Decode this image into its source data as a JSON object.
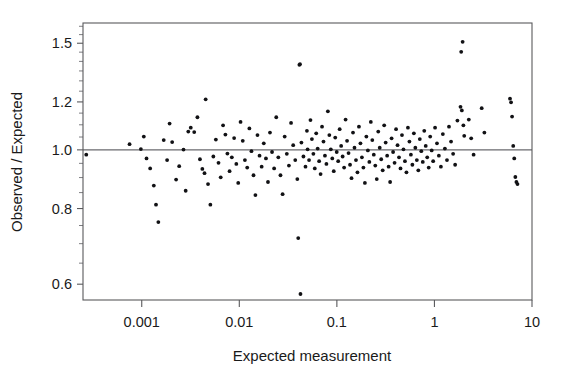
{
  "chart_data": {
    "type": "scatter",
    "title": "",
    "xlabel": "Expected measurement",
    "ylabel": "Observed / Expected",
    "xscale": "log",
    "yscale": "log",
    "xlim": [
      0.00025,
      10
    ],
    "ylim": [
      0.565,
      1.62
    ],
    "xticks": [
      0.001,
      0.01,
      0.1,
      1,
      10
    ],
    "xticklabels": [
      "0.001",
      "0.01",
      "0.1",
      "1",
      "10"
    ],
    "yticks": [
      0.6,
      0.8,
      1.0,
      1.2,
      1.5
    ],
    "yticklabels": [
      "0.6",
      "0.8",
      "1.0",
      "1.2",
      "1.5"
    ],
    "yminorticks": [
      0.65,
      0.7,
      0.75,
      0.85,
      0.9,
      0.95,
      1.05,
      1.1,
      1.15,
      1.25,
      1.3,
      1.35,
      1.4,
      1.45,
      1.55,
      1.6
    ],
    "grid": false,
    "legend": false,
    "reference_line": {
      "orientation": "horizontal",
      "value": 1.0,
      "label": "unity line"
    },
    "marker": {
      "shape": "circle",
      "color": "#111114",
      "size": 1.9
    },
    "n_points": 190,
    "points": [
      [
        0.00027,
        0.982
      ],
      [
        0.00075,
        1.022
      ],
      [
        0.00098,
        1.003
      ],
      [
        0.00105,
        1.052
      ],
      [
        0.00112,
        0.968
      ],
      [
        0.00122,
        0.932
      ],
      [
        0.00133,
        0.873
      ],
      [
        0.0014,
        0.812
      ],
      [
        0.00148,
        0.76
      ],
      [
        0.00168,
        1.038
      ],
      [
        0.00182,
        0.962
      ],
      [
        0.00193,
        1.105
      ],
      [
        0.00205,
        1.03
      ],
      [
        0.00225,
        0.893
      ],
      [
        0.00242,
        0.94
      ],
      [
        0.00268,
        1.001
      ],
      [
        0.00282,
        0.856
      ],
      [
        0.003,
        1.072
      ],
      [
        0.00318,
        1.088
      ],
      [
        0.00345,
        1.07
      ],
      [
        0.00372,
        1.132
      ],
      [
        0.00395,
        0.965
      ],
      [
        0.00418,
        0.93
      ],
      [
        0.0044,
        0.915
      ],
      [
        0.00452,
        1.212
      ],
      [
        0.00478,
        0.878
      ],
      [
        0.00505,
        0.812
      ],
      [
        0.00542,
        0.975
      ],
      [
        0.00575,
        1.04
      ],
      [
        0.00612,
        0.952
      ],
      [
        0.00645,
        0.901
      ],
      [
        0.00682,
        1.098
      ],
      [
        0.0072,
        1.06
      ],
      [
        0.00755,
        0.986
      ],
      [
        0.00795,
        0.922
      ],
      [
        0.00838,
        0.972
      ],
      [
        0.00885,
        1.046
      ],
      [
        0.00932,
        0.948
      ],
      [
        0.00975,
        0.882
      ],
      [
        0.0103,
        1.112
      ],
      [
        0.01085,
        1.035
      ],
      [
        0.01142,
        0.962
      ],
      [
        0.01205,
        0.935
      ],
      [
        0.01268,
        1.085
      ],
      [
        0.01332,
        0.995
      ],
      [
        0.01398,
        0.908
      ],
      [
        0.01462,
        0.842
      ],
      [
        0.01535,
        1.058
      ],
      [
        0.01612,
        0.978
      ],
      [
        0.01695,
        0.938
      ],
      [
        0.01782,
        1.025
      ],
      [
        0.01875,
        0.968
      ],
      [
        0.01968,
        0.885
      ],
      [
        0.02062,
        1.068
      ],
      [
        0.02165,
        0.992
      ],
      [
        0.02275,
        0.932
      ],
      [
        0.02392,
        1.132
      ],
      [
        0.02512,
        0.972
      ],
      [
        0.02642,
        0.908
      ],
      [
        0.02778,
        0.845
      ],
      [
        0.02918,
        1.052
      ],
      [
        0.03068,
        0.985
      ],
      [
        0.03225,
        0.942
      ],
      [
        0.03392,
        1.108
      ],
      [
        0.03568,
        1.018
      ],
      [
        0.03745,
        0.962
      ],
      [
        0.03932,
        0.895
      ],
      [
        0.04018,
        0.715
      ],
      [
        0.04128,
        1.382
      ],
      [
        0.04188,
        1.385
      ],
      [
        0.04235,
        0.578
      ],
      [
        0.04332,
        1.028
      ],
      [
        0.04542,
        0.975
      ],
      [
        0.04768,
        0.938
      ],
      [
        0.04932,
        1.075
      ],
      [
        0.05012,
        1.002
      ],
      [
        0.05188,
        0.962
      ],
      [
        0.05362,
        1.12
      ],
      [
        0.05548,
        1.042
      ],
      [
        0.05742,
        0.985
      ],
      [
        0.05938,
        0.932
      ],
      [
        0.06142,
        1.065
      ],
      [
        0.06355,
        1.005
      ],
      [
        0.06578,
        0.958
      ],
      [
        0.06808,
        0.912
      ],
      [
        0.07045,
        1.092
      ],
      [
        0.07292,
        1.032
      ],
      [
        0.07548,
        0.978
      ],
      [
        0.07812,
        0.948
      ],
      [
        0.08088,
        1.158
      ],
      [
        0.08372,
        1.058
      ],
      [
        0.08668,
        1.002
      ],
      [
        0.08975,
        0.968
      ],
      [
        0.09292,
        0.922
      ],
      [
        0.09622,
        1.048
      ],
      [
        0.09962,
        0.992
      ],
      [
        0.10315,
        0.958
      ],
      [
        0.10682,
        1.082
      ],
      [
        0.11062,
        1.015
      ],
      [
        0.11455,
        0.975
      ],
      [
        0.11862,
        0.935
      ],
      [
        0.12285,
        1.122
      ],
      [
        0.12722,
        1.035
      ],
      [
        0.13175,
        0.988
      ],
      [
        0.13645,
        0.945
      ],
      [
        0.14132,
        0.898
      ],
      [
        0.14635,
        1.068
      ],
      [
        0.15158,
        1.008
      ],
      [
        0.15698,
        0.962
      ],
      [
        0.16258,
        0.918
      ],
      [
        0.16838,
        1.092
      ],
      [
        0.17438,
        1.025
      ],
      [
        0.1806,
        0.972
      ],
      [
        0.18705,
        0.935
      ],
      [
        0.19372,
        0.882
      ],
      [
        0.20062,
        1.052
      ],
      [
        0.20778,
        0.998
      ],
      [
        0.21518,
        0.955
      ],
      [
        0.22285,
        1.112
      ],
      [
        0.2308,
        1.038
      ],
      [
        0.23902,
        0.982
      ],
      [
        0.24755,
        0.942
      ],
      [
        0.25638,
        0.895
      ],
      [
        0.26552,
        1.072
      ],
      [
        0.27498,
        1.008
      ],
      [
        0.28478,
        0.965
      ],
      [
        0.29493,
        0.925
      ],
      [
        0.30545,
        1.098
      ],
      [
        0.31632,
        1.028
      ],
      [
        0.3276,
        0.978
      ],
      [
        0.33928,
        0.938
      ],
      [
        0.35138,
        0.885
      ],
      [
        0.3639,
        1.045
      ],
      [
        0.37688,
        0.992
      ],
      [
        0.39032,
        0.952
      ],
      [
        0.40422,
        1.082
      ],
      [
        0.41862,
        1.018
      ],
      [
        0.43355,
        0.972
      ],
      [
        0.44902,
        0.932
      ],
      [
        0.46502,
        1.058
      ],
      [
        0.4816,
        1.002
      ],
      [
        0.49878,
        0.958
      ],
      [
        0.51655,
        0.918
      ],
      [
        0.53498,
        1.088
      ],
      [
        0.55405,
        1.032
      ],
      [
        0.57382,
        0.982
      ],
      [
        0.59428,
        0.945
      ],
      [
        0.61548,
        1.065
      ],
      [
        0.63742,
        1.008
      ],
      [
        0.66015,
        0.962
      ],
      [
        0.68368,
        0.925
      ],
      [
        0.70805,
        1.042
      ],
      [
        0.73328,
        0.995
      ],
      [
        0.75942,
        0.955
      ],
      [
        0.7865,
        1.075
      ],
      [
        0.81452,
        1.015
      ],
      [
        0.84355,
        0.972
      ],
      [
        0.87362,
        0.935
      ],
      [
        0.90478,
        1.052
      ],
      [
        0.93702,
        0.998
      ],
      [
        0.97042,
        0.958
      ],
      [
        1.015,
        1.088
      ],
      [
        1.062,
        1.025
      ],
      [
        1.11,
        0.978
      ],
      [
        1.165,
        0.938
      ],
      [
        1.22,
        1.062
      ],
      [
        1.28,
        1.005
      ],
      [
        1.345,
        0.962
      ],
      [
        1.41,
        1.092
      ],
      [
        1.48,
        1.032
      ],
      [
        1.555,
        0.985
      ],
      [
        1.63,
        0.945
      ],
      [
        1.72,
        1.118
      ],
      [
        1.85,
        1.178
      ],
      [
        1.88,
        1.452
      ],
      [
        1.91,
        1.162
      ],
      [
        1.945,
        1.508
      ],
      [
        1.98,
        1.098
      ],
      [
        2.02,
        1.055
      ],
      [
        2.25,
        1.122
      ],
      [
        2.38,
        1.045
      ],
      [
        2.52,
        0.982
      ],
      [
        3.05,
        1.172
      ],
      [
        3.25,
        1.068
      ],
      [
        5.95,
        1.215
      ],
      [
        6.1,
        1.198
      ],
      [
        6.25,
        1.135
      ],
      [
        6.42,
        1.015
      ],
      [
        6.58,
        0.968
      ],
      [
        6.75,
        0.902
      ],
      [
        6.92,
        0.885
      ],
      [
        7.1,
        0.878
      ]
    ]
  },
  "axes": {
    "x_title": "Expected measurement",
    "y_title": "Observed / Expected"
  }
}
